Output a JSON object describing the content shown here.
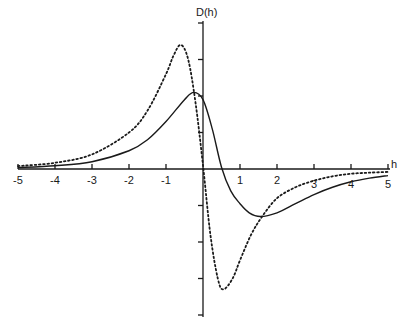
{
  "chart_data": {
    "type": "line",
    "title": "",
    "xlabel": "h",
    "ylabel": "D(h)",
    "xlim": [
      -5,
      5
    ],
    "ylim": [
      -4,
      4
    ],
    "grid": false,
    "legend": null,
    "x_ticks": [
      -5,
      -4,
      -3,
      -2,
      -1,
      1,
      2,
      3,
      4,
      5
    ],
    "x_tick_labels": [
      "-5",
      "-4",
      "-3",
      "-2",
      "-1",
      "1",
      "2",
      "3",
      "4",
      "5"
    ],
    "y_ticks": [
      -4,
      -3,
      -2,
      -1,
      1,
      2,
      3,
      4
    ],
    "series": [
      {
        "name": "solid",
        "style": "solid",
        "x": [
          -5,
          -4,
          -3,
          -2,
          -1.5,
          -1,
          -0.5,
          -0.25,
          0,
          0.25,
          0.5,
          0.75,
          1,
          1.25,
          1.55,
          2,
          2.5,
          3,
          3.5,
          4,
          4.5,
          5
        ],
        "y": [
          0.04,
          0.09,
          0.2,
          0.5,
          0.8,
          1.3,
          1.9,
          2.1,
          1.9,
          1.1,
          0.05,
          -0.6,
          -0.95,
          -1.2,
          -1.3,
          -1.2,
          -0.95,
          -0.7,
          -0.5,
          -0.35,
          -0.25,
          -0.18
        ]
      },
      {
        "name": "dotted",
        "style": "dotted",
        "x": [
          -5,
          -4,
          -3,
          -2,
          -1.5,
          -1,
          -0.8,
          -0.6,
          -0.4,
          -0.2,
          0,
          0.2,
          0.4,
          0.55,
          0.8,
          1,
          1.3,
          1.6,
          2,
          2.5,
          3,
          3.5,
          4,
          4.5,
          5
        ],
        "y": [
          0.08,
          0.17,
          0.4,
          1.0,
          1.6,
          2.6,
          3.1,
          3.4,
          3.0,
          1.8,
          0.1,
          -1.8,
          -3.0,
          -3.3,
          -3.0,
          -2.5,
          -1.8,
          -1.3,
          -0.8,
          -0.5,
          -0.32,
          -0.2,
          -0.13,
          -0.1,
          -0.08
        ]
      }
    ]
  },
  "labels": {
    "x_axis_title": "h",
    "y_axis_title": "D(h)"
  }
}
